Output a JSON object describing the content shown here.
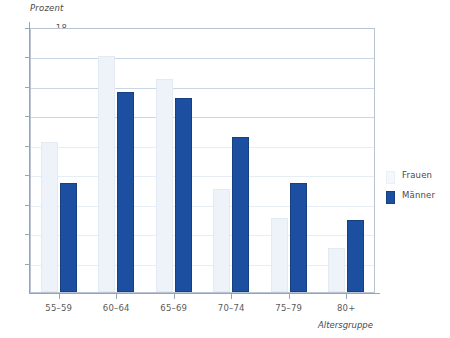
{
  "chart_data": {
    "type": "bar",
    "title": "",
    "subtitle": "",
    "xlabel": "Altersgruppe",
    "ylabel": "Prozent",
    "categories": [
      "55–59",
      "60–64",
      "65–69",
      "70–74",
      "75–79",
      "80+"
    ],
    "series": [
      {
        "name": "Frauen",
        "color": "#eef2f9",
        "values": [
          10.2,
          16.0,
          14.5,
          7.0,
          5.0,
          3.0
        ]
      },
      {
        "name": "Männer",
        "color": "#1c4fa0",
        "values": [
          7.4,
          13.6,
          13.2,
          10.5,
          7.4,
          4.9
        ]
      }
    ],
    "ylim": [
      0,
      18
    ],
    "yticks": [
      2,
      4,
      6,
      8,
      10,
      12,
      14,
      16,
      18
    ],
    "ytick_labels": [
      "2",
      "4",
      "6",
      "8",
      "10",
      "12",
      "14",
      "16",
      "18"
    ],
    "grid": true,
    "grid_axis": "y",
    "legend_position": "right"
  },
  "axes": {
    "y_title": "Prozent",
    "x_title": "Altersgruppe"
  },
  "legend": {
    "items": [
      {
        "label": "Frauen",
        "swatch": "frauen-swatch"
      },
      {
        "label": "Männer",
        "swatch": "maenner-swatch"
      }
    ]
  },
  "colors": {
    "frauen": "#eef2f9",
    "maenner": "#1c4fa0",
    "grid": "#c9d6e6",
    "frame": "#b9c4d4",
    "axis": "#97a4b6",
    "text": "#4a4a4a"
  }
}
